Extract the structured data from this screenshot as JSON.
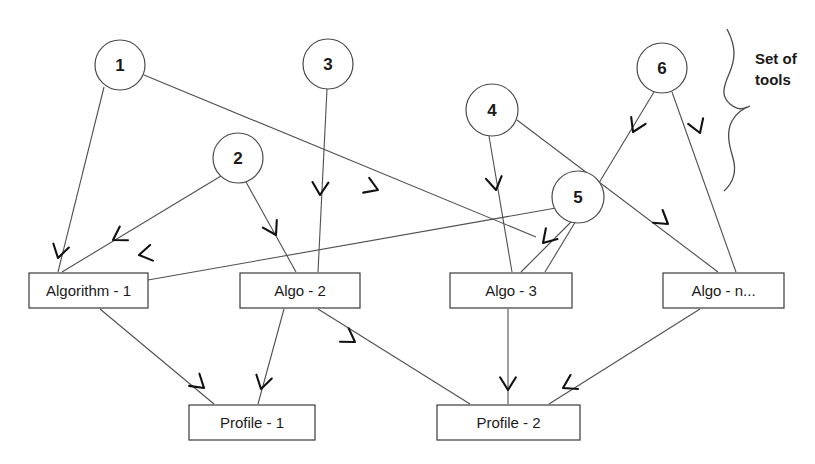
{
  "diagram": {
    "annotation": {
      "text_line1": "Set of",
      "text_line2": "tools",
      "brace_name": "curly-brace"
    },
    "colors": {
      "background": "#ffffff",
      "line": "#4f4f4f",
      "arrow": "#111111",
      "text": "#1a1a1a",
      "shape_stroke": "#3a3a3a"
    },
    "tool_nodes": [
      {
        "id": "tool-1",
        "label": "1",
        "cx": 120,
        "cy": 65,
        "r": 25
      },
      {
        "id": "tool-2",
        "label": "2",
        "cx": 238,
        "cy": 158,
        "r": 25
      },
      {
        "id": "tool-3",
        "label": "3",
        "cx": 328,
        "cy": 64,
        "r": 25
      },
      {
        "id": "tool-4",
        "label": "4",
        "cx": 492,
        "cy": 110,
        "r": 26
      },
      {
        "id": "tool-5",
        "label": "5",
        "cx": 578,
        "cy": 197,
        "r": 26
      },
      {
        "id": "tool-6",
        "label": "6",
        "cx": 662,
        "cy": 68,
        "r": 25
      }
    ],
    "algorithm_boxes": [
      {
        "id": "algorithm-1",
        "label": "Algorithm - 1",
        "x": 29,
        "y": 273,
        "w": 119,
        "h": 35
      },
      {
        "id": "algo-2",
        "label": "Algo  - 2",
        "x": 240,
        "y": 273,
        "w": 120,
        "h": 35
      },
      {
        "id": "algo-3",
        "label": "Algo  - 3",
        "x": 450,
        "y": 273,
        "w": 122,
        "h": 35
      },
      {
        "id": "algo-n",
        "label": "Algo  - n...",
        "x": 663,
        "y": 273,
        "w": 121,
        "h": 35
      }
    ],
    "profile_boxes": [
      {
        "id": "profile-1",
        "label": "Profile - 1",
        "x": 189,
        "y": 405,
        "w": 126,
        "h": 35
      },
      {
        "id": "profile-2",
        "label": "Profile - 2",
        "x": 437,
        "y": 405,
        "w": 143,
        "h": 35
      }
    ],
    "edges": [
      {
        "id": "e1",
        "from": "tool-1",
        "to": "algorithm-1",
        "x1": 104,
        "y1": 87,
        "x2": 58,
        "y2": 272
      },
      {
        "id": "e2",
        "from": "tool-1",
        "to": "algo-3",
        "x1": 144,
        "y1": 75,
        "x2": 536,
        "y2": 237
      },
      {
        "id": "e3",
        "from": "tool-2",
        "to": "algorithm-1",
        "x1": 221,
        "y1": 176,
        "x2": 62,
        "y2": 272
      },
      {
        "id": "e4",
        "from": "tool-2",
        "to": "algo-2",
        "x1": 246,
        "y1": 182,
        "x2": 296,
        "y2": 272
      },
      {
        "id": "e5",
        "from": "tool-3",
        "to": "algo-2",
        "x1": 327,
        "y1": 89,
        "x2": 318,
        "y2": 272
      },
      {
        "id": "e6",
        "from": "tool-4",
        "to": "algo-3",
        "x1": 489,
        "y1": 136,
        "x2": 512,
        "y2": 272
      },
      {
        "id": "e7",
        "from": "tool-4",
        "to": "algo-n",
        "x1": 517,
        "y1": 120,
        "x2": 718,
        "y2": 272
      },
      {
        "id": "e8",
        "from": "tool-5",
        "to": "algorithm-1",
        "x1": 556,
        "y1": 208,
        "x2": 148,
        "y2": 280
      },
      {
        "id": "e9",
        "from": "tool-5",
        "to": "algo-3",
        "x1": 571,
        "y1": 222,
        "x2": 521,
        "y2": 272
      },
      {
        "id": "e10",
        "from": "tool-6",
        "to": "algo-3",
        "x1": 654,
        "y1": 92,
        "x2": 545,
        "y2": 272
      },
      {
        "id": "e11",
        "from": "tool-6",
        "to": "algo-n",
        "x1": 672,
        "y1": 92,
        "x2": 736,
        "y2": 272
      },
      {
        "id": "e12",
        "from": "algorithm-1",
        "to": "profile-1",
        "x1": 100,
        "y1": 309,
        "x2": 214,
        "y2": 404
      },
      {
        "id": "e13",
        "from": "algo-2",
        "to": "profile-1",
        "x1": 284,
        "y1": 309,
        "x2": 258,
        "y2": 404
      },
      {
        "id": "e14",
        "from": "algo-2",
        "to": "profile-2",
        "x1": 318,
        "y1": 309,
        "x2": 470,
        "y2": 404
      },
      {
        "id": "e15",
        "from": "algo-3",
        "to": "profile-2",
        "x1": 508,
        "y1": 309,
        "x2": 508,
        "y2": 404
      },
      {
        "id": "e16",
        "from": "algo-n",
        "to": "profile-2",
        "x1": 700,
        "y1": 309,
        "x2": 549,
        "y2": 404
      }
    ],
    "arrow_heads": [
      {
        "id": "a1",
        "edge": "e1",
        "x": 58,
        "y": 258,
        "angle": 104
      },
      {
        "id": "a2",
        "edge": "e2",
        "x": 378,
        "y": 190,
        "angle": 22
      },
      {
        "id": "a3",
        "edge": "e3",
        "x": 113,
        "y": 240,
        "angle": 149
      },
      {
        "id": "a4",
        "edge": "e4",
        "x": 276,
        "y": 235,
        "angle": 61
      },
      {
        "id": "a5",
        "edge": "e5",
        "x": 320,
        "y": 195,
        "angle": 92
      },
      {
        "id": "a6",
        "edge": "e6",
        "x": 496,
        "y": 190,
        "angle": 80
      },
      {
        "id": "a7",
        "edge": "e7",
        "x": 668,
        "y": 224,
        "angle": 37
      },
      {
        "id": "a8",
        "edge": "e8",
        "x": 139,
        "y": 255,
        "angle": 170
      },
      {
        "id": "a9",
        "edge": "e9",
        "x": 543,
        "y": 243,
        "angle": 133
      },
      {
        "id": "a10",
        "edge": "e10",
        "x": 633,
        "y": 132,
        "angle": 115
      },
      {
        "id": "a11",
        "edge": "e11",
        "x": 700,
        "y": 133,
        "angle": 70
      },
      {
        "id": "a12",
        "edge": "e12",
        "x": 204,
        "y": 388,
        "angle": 40
      },
      {
        "id": "a13",
        "edge": "e13",
        "x": 261,
        "y": 389,
        "angle": 104
      },
      {
        "id": "a14",
        "edge": "e14",
        "x": 355,
        "y": 342,
        "angle": 33
      },
      {
        "id": "a15",
        "edge": "e15",
        "x": 508,
        "y": 390,
        "angle": 90
      },
      {
        "id": "a16",
        "edge": "e16",
        "x": 563,
        "y": 388,
        "angle": 152
      }
    ]
  }
}
